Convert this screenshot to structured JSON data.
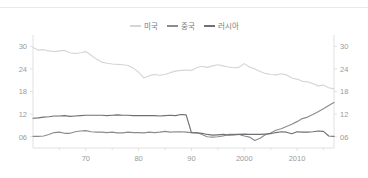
{
  "chart_data": {
    "type": "line",
    "title": "",
    "subtitle": "",
    "xlabel": "",
    "ylabel": "",
    "xlim": [
      1960,
      2017
    ],
    "ylim": [
      3,
      33
    ],
    "grid": false,
    "legend_position": "top-center",
    "y_ticks": [
      "06",
      "12",
      "18",
      "24",
      "30"
    ],
    "y_tick_values": [
      6,
      12,
      18,
      24,
      30
    ],
    "x_ticks": [
      "70",
      "80",
      "90",
      "2000",
      "2010"
    ],
    "x_tick_values": [
      1970,
      1980,
      1990,
      2000,
      2010
    ],
    "dual_y_axis": true,
    "x": [
      1960,
      1961,
      1962,
      1963,
      1964,
      1965,
      1966,
      1967,
      1968,
      1969,
      1970,
      1971,
      1972,
      1973,
      1974,
      1975,
      1976,
      1977,
      1978,
      1979,
      1980,
      1981,
      1982,
      1983,
      1984,
      1985,
      1986,
      1987,
      1988,
      1989,
      1990,
      1991,
      1992,
      1993,
      1994,
      1995,
      1996,
      1997,
      1998,
      1999,
      2000,
      2001,
      2002,
      2003,
      2004,
      2005,
      2006,
      2007,
      2008,
      2009,
      2010,
      2011,
      2012,
      2013,
      2014,
      2015,
      2016,
      2017
    ],
    "series": [
      {
        "name": "미국",
        "color": "#d5d5d7",
        "values": [
          29.7,
          29.0,
          29.1,
          28.8,
          28.6,
          28.8,
          28.9,
          28.3,
          28.1,
          28.3,
          28.6,
          27.6,
          26.6,
          25.8,
          25.5,
          25.3,
          25.2,
          25.1,
          24.9,
          24.2,
          23.1,
          21.6,
          22.2,
          22.5,
          22.3,
          22.5,
          23.0,
          23.4,
          23.6,
          23.7,
          23.6,
          24.3,
          24.7,
          24.4,
          24.8,
          25.1,
          24.8,
          24.5,
          24.3,
          24.4,
          25.4,
          24.5,
          24.0,
          23.3,
          22.8,
          22.5,
          22.4,
          22.7,
          22.4,
          21.6,
          21.3,
          20.7,
          20.6,
          20.1,
          19.5,
          19.7,
          19.0,
          18.7
        ]
      },
      {
        "name": "중국",
        "color": "#8c8c90",
        "values": [
          6.1,
          6.1,
          6.2,
          6.6,
          7.1,
          7.2,
          6.9,
          6.9,
          7.3,
          7.5,
          7.6,
          7.3,
          7.2,
          7.2,
          7.1,
          7.2,
          7.0,
          7.0,
          7.2,
          7.1,
          7.1,
          7.0,
          7.2,
          7.1,
          7.2,
          7.4,
          7.2,
          7.3,
          7.3,
          7.2,
          7.1,
          7.1,
          6.6,
          6.0,
          5.9,
          6.0,
          6.2,
          6.6,
          6.6,
          6.6,
          6.2,
          5.9,
          5.0,
          5.6,
          6.5,
          7.0,
          7.7,
          8.1,
          8.7,
          9.3,
          10.0,
          10.8,
          11.2,
          11.9,
          12.6,
          13.4,
          14.3,
          15.1
        ]
      },
      {
        "name": "러시아",
        "color": "#6f6f74",
        "values": [
          10.9,
          11.0,
          11.2,
          11.3,
          11.5,
          11.5,
          11.6,
          11.4,
          11.5,
          11.6,
          11.7,
          11.7,
          11.7,
          11.7,
          11.6,
          11.7,
          11.8,
          11.7,
          11.7,
          11.6,
          11.6,
          11.6,
          11.6,
          11.6,
          11.5,
          11.6,
          11.7,
          11.6,
          11.9,
          11.8,
          7.1,
          7.0,
          6.9,
          6.6,
          6.4,
          6.5,
          6.6,
          6.4,
          6.5,
          6.6,
          6.7,
          6.6,
          6.6,
          6.6,
          6.7,
          6.8,
          7.1,
          7.3,
          7.2,
          6.8,
          7.3,
          7.2,
          7.2,
          7.3,
          7.5,
          7.4,
          6.2,
          6.1
        ]
      }
    ]
  },
  "legend": {
    "items": [
      {
        "label": "미국",
        "color": "#d5d5d7"
      },
      {
        "label": "중국",
        "color": "#8c8c90"
      },
      {
        "label": "러시아",
        "color": "#6f6f74"
      }
    ]
  },
  "axes": {
    "left_labels": [
      "30",
      "24",
      "18",
      "12",
      "06"
    ],
    "right_labels": [
      "30",
      "24",
      "18",
      "12",
      "06"
    ],
    "bottom_labels": [
      "70",
      "80",
      "90",
      "2000",
      "2010"
    ]
  }
}
